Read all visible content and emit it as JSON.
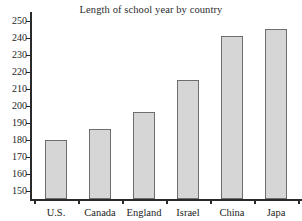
{
  "chart_data": {
    "type": "bar",
    "title": "Length of school year by country",
    "xlabel": "",
    "ylabel": "",
    "categories": [
      "U.S.",
      "Canada",
      "England",
      "Israel",
      "China",
      "Japa"
    ],
    "values": [
      180,
      186,
      196,
      215,
      241,
      245
    ],
    "ylim": [
      145,
      255
    ],
    "y_ticks": [
      150,
      160,
      170,
      180,
      190,
      200,
      210,
      220,
      230,
      240,
      250
    ],
    "grid": false,
    "legend": false,
    "legend_position": "none",
    "bar_fill_color": "#d6d6d6",
    "bar_border_color": "#6e6e6e",
    "axis_color": "#2a2a2a",
    "text_color": "#1c1c1c",
    "background_color": "#ffffff"
  }
}
